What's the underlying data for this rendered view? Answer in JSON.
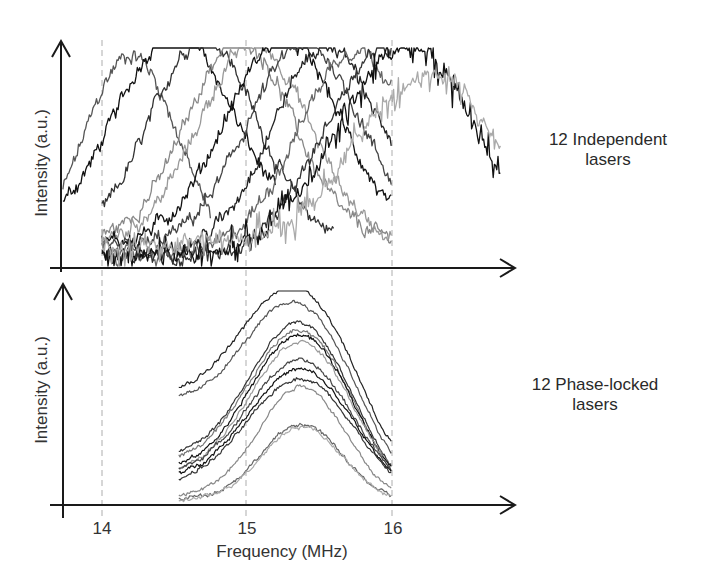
{
  "chart_data": [
    {
      "type": "line",
      "panel": "top",
      "title": "",
      "annotation": [
        "12 Independent",
        "lasers"
      ],
      "xlabel": "Frequency (MHz)",
      "ylabel": "Intensity (a.u.)",
      "xlim": [
        13.73,
        16.9
      ],
      "ylim": [
        0,
        1
      ],
      "xticks": [
        14,
        15,
        16
      ],
      "grid": "dashed vertical lines at 14, 15, 16",
      "description": "12 independently tuned lasers; broad noisy spectra with peaks spread from ~14.2 to ~16.1 MHz",
      "series": [
        {
          "name": "laser 1",
          "x_range": [
            13.73,
            14.75
          ],
          "peak_freq": 14.2,
          "width": 0.33,
          "peak": 0.97,
          "floor": 0.0,
          "color": "#555555"
        },
        {
          "name": "laser 2",
          "x_range": [
            13.73,
            15.2
          ],
          "peak_freq": 14.5,
          "width": 0.4,
          "peak": 0.97,
          "floor": 0.15,
          "color": "#111111"
        },
        {
          "name": "laser 3",
          "x_range": [
            14.0,
            15.6
          ],
          "peak_freq": 14.7,
          "width": 0.36,
          "peak": 0.97,
          "floor": 0.12,
          "color": "#333333"
        },
        {
          "name": "laser 4",
          "x_range": [
            14.0,
            16.0
          ],
          "peak_freq": 14.95,
          "width": 0.36,
          "peak": 0.96,
          "floor": 0.12,
          "color": "#888888"
        },
        {
          "name": "laser 5",
          "x_range": [
            14.0,
            16.0
          ],
          "peak_freq": 15.05,
          "width": 0.38,
          "peak": 0.95,
          "floor": 0.1,
          "color": "#999999"
        },
        {
          "name": "laser 6",
          "x_range": [
            14.0,
            16.0
          ],
          "peak_freq": 15.25,
          "width": 0.4,
          "peak": 0.97,
          "floor": 0.1,
          "color": "#111111"
        },
        {
          "name": "laser 7",
          "x_range": [
            14.0,
            16.0
          ],
          "peak_freq": 15.4,
          "width": 0.4,
          "peak": 0.96,
          "floor": 0.08,
          "color": "#444444"
        },
        {
          "name": "laser 8",
          "x_range": [
            14.0,
            16.0
          ],
          "peak_freq": 15.55,
          "width": 0.38,
          "peak": 0.97,
          "floor": 0.06,
          "color": "#222222"
        },
        {
          "name": "laser 9",
          "x_range": [
            14.0,
            16.0
          ],
          "peak_freq": 15.75,
          "width": 0.4,
          "peak": 0.96,
          "floor": 0.05,
          "color": "#666666"
        },
        {
          "name": "laser 10",
          "x_range": [
            14.0,
            16.0
          ],
          "peak_freq": 15.95,
          "width": 0.42,
          "peak": 0.97,
          "floor": 0.04,
          "color": "#333333"
        },
        {
          "name": "laser 11",
          "x_range": [
            14.0,
            16.75
          ],
          "peak_freq": 16.1,
          "width": 0.48,
          "peak": 0.97,
          "floor": 0.05,
          "color": "#111111"
        },
        {
          "name": "laser 12",
          "x_range": [
            14.0,
            16.75
          ],
          "peak_freq": 16.25,
          "width": 0.5,
          "peak": 0.8,
          "floor": 0.1,
          "color": "#aaaaaa"
        }
      ]
    },
    {
      "type": "line",
      "panel": "bottom",
      "title": "",
      "annotation": [
        "12 Phase-locked",
        "lasers"
      ],
      "xlabel": "Frequency (MHz)",
      "ylabel": "Intensity (a.u.)",
      "xlim": [
        13.73,
        16.9
      ],
      "ylim": [
        0,
        1
      ],
      "xticks": [
        14,
        15,
        16
      ],
      "grid": "dashed vertical lines at 14, 15, 16",
      "description": "12 phase-locked lasers; all spectra coincide with a common peak near 15.38 MHz, differing only in amplitude",
      "series": [
        {
          "name": "laser 1",
          "x_range": [
            14.53,
            16.0
          ],
          "peak_freq": 15.38,
          "width": 0.42,
          "peak": 0.97,
          "floor": 0.44,
          "color": "#222222"
        },
        {
          "name": "laser 2",
          "x_range": [
            14.53,
            16.0
          ],
          "peak_freq": 15.38,
          "width": 0.4,
          "peak": 0.9,
          "floor": 0.42,
          "color": "#555555"
        },
        {
          "name": "laser 3",
          "x_range": [
            14.53,
            16.0
          ],
          "peak_freq": 15.38,
          "width": 0.36,
          "peak": 0.83,
          "floor": 0.2,
          "color": "#333333"
        },
        {
          "name": "laser 4",
          "x_range": [
            14.53,
            16.0
          ],
          "peak_freq": 15.38,
          "width": 0.36,
          "peak": 0.8,
          "floor": 0.18,
          "color": "#777777"
        },
        {
          "name": "laser 5",
          "x_range": [
            14.53,
            16.0
          ],
          "peak_freq": 15.38,
          "width": 0.36,
          "peak": 0.78,
          "floor": 0.14,
          "color": "#111111"
        },
        {
          "name": "laser 6",
          "x_range": [
            14.53,
            16.0
          ],
          "peak_freq": 15.38,
          "width": 0.36,
          "peak": 0.75,
          "floor": 0.12,
          "color": "#999999"
        },
        {
          "name": "laser 7",
          "x_range": [
            14.53,
            16.0
          ],
          "peak_freq": 15.38,
          "width": 0.37,
          "peak": 0.66,
          "floor": 0.12,
          "color": "#444444"
        },
        {
          "name": "laser 8",
          "x_range": [
            14.53,
            16.0
          ],
          "peak_freq": 15.38,
          "width": 0.37,
          "peak": 0.62,
          "floor": 0.1,
          "color": "#111111"
        },
        {
          "name": "laser 9",
          "x_range": [
            14.53,
            16.0
          ],
          "peak_freq": 15.38,
          "width": 0.37,
          "peak": 0.58,
          "floor": 0.08,
          "color": "#333333"
        },
        {
          "name": "laser 10",
          "x_range": [
            14.53,
            16.0
          ],
          "peak_freq": 15.38,
          "width": 0.3,
          "peak": 0.55,
          "floor": 0.03,
          "color": "#888888"
        },
        {
          "name": "laser 11",
          "x_range": [
            14.53,
            16.0
          ],
          "peak_freq": 15.38,
          "width": 0.28,
          "peak": 0.37,
          "floor": 0.02,
          "color": "#666666"
        },
        {
          "name": "laser 12",
          "x_range": [
            14.53,
            16.0
          ],
          "peak_freq": 15.38,
          "width": 0.28,
          "peak": 0.36,
          "floor": 0.01,
          "color": "#aaaaaa"
        }
      ]
    }
  ],
  "labels": {
    "top_panel_line1": "12 Independent",
    "top_panel_line2": "lasers",
    "bottom_panel_line1": "12 Phase-locked",
    "bottom_panel_line2": "lasers",
    "ylabel_top": "Intensity (a.u.)",
    "ylabel_bottom": "Intensity (a.u.)",
    "xlabel": "Frequency (MHz)",
    "xticks": [
      "14",
      "15",
      "16"
    ]
  },
  "colors": {
    "axis": "#1a1a1a",
    "gridline": "#bbbbbb",
    "text": "#333333"
  }
}
